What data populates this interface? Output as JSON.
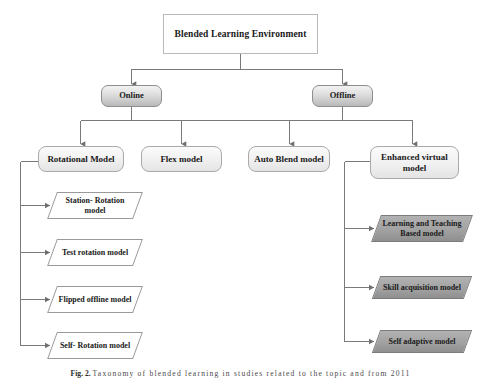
{
  "figure": {
    "title": "Blended Learning Environment",
    "caption_label": "Fig. 2.",
    "caption_text": "Taxonomy of blended learning in studies related to the topic and from 2011"
  },
  "colors": {
    "page_background": "#ffffff",
    "connector_line": "#7a7a7a",
    "root_border": "#b9b9b9",
    "pill_fill_top": "#f2f2f2",
    "pill_fill_bottom": "#b9b9b9",
    "box_fill": "#f0f0f0",
    "parallelogram_white_fill": "#ffffff",
    "parallelogram_grey_fill": "#a2a2a2",
    "text": "#1a1a1a"
  },
  "levels": {
    "level1": {
      "name": "root",
      "node": {
        "id": "blended-learning-environment",
        "label": "Blended Learning Environment"
      }
    },
    "level2": {
      "name": "delivery-mode",
      "nodes": [
        {
          "id": "online",
          "label": "Online"
        },
        {
          "id": "offline",
          "label": "Offline"
        }
      ]
    },
    "level3": {
      "name": "model-categories",
      "nodes": [
        {
          "id": "rotational-model",
          "label": "Rotational Model",
          "parent": "online"
        },
        {
          "id": "flex-model",
          "label": "Flex model",
          "parent": "online"
        },
        {
          "id": "auto-blend-model",
          "label": "Auto Blend model",
          "parent": "offline"
        },
        {
          "id": "enhanced-virtual-model",
          "label": "Enhanced virtual model",
          "parent": "offline"
        }
      ]
    },
    "level4_left": {
      "name": "rotational-submodels",
      "parent": "rotational-model",
      "nodes": [
        {
          "id": "station-rotation-model",
          "label": "Station- Rotation model"
        },
        {
          "id": "test-rotation-model",
          "label": "Test rotation model"
        },
        {
          "id": "flipped-offline-model",
          "label": "Flipped offline model"
        },
        {
          "id": "self-rotation-model",
          "label": "Self- Rotation model"
        }
      ]
    },
    "level4_right": {
      "name": "enhanced-virtual-submodels",
      "parent": "enhanced-virtual-model",
      "nodes": [
        {
          "id": "learning-and-teaching-based-model",
          "label": "Learning and Teaching Based model"
        },
        {
          "id": "skill-acquisition-model",
          "label": "Skill acquisition model"
        },
        {
          "id": "self-adaptive-model",
          "label": "Self adaptive model"
        }
      ]
    }
  }
}
